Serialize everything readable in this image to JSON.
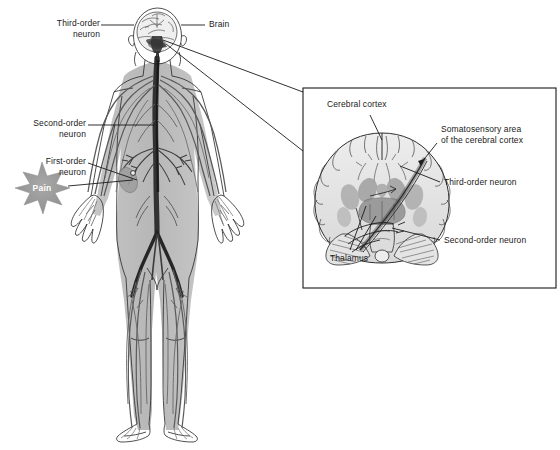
{
  "figure": {
    "background_color": "#ffffff",
    "line_color": "#1a1a1a",
    "body_fill": "#b9b9b9",
    "nerve_color": "#5a5a5a",
    "spinal_cord_color": "#2b2b2b",
    "brain_fill": "#e2e2e2",
    "gray_matter_color": "#a6a6a6",
    "star_fill": "#9a9a9a",
    "star_text_color": "#ffffff"
  },
  "body_panel": {
    "labels": {
      "third_order_neuron": "Third-order\nneuron",
      "brain": "Brain",
      "second_order_neuron": "Second-order\nneuron",
      "first_order_neuron": "First-order\nneuron",
      "pain": "Pain"
    }
  },
  "inset_panel": {
    "border_color": "#1a1a1a",
    "labels": {
      "cerebral_cortex": "Cerebral cortex",
      "somatosensory_area": "Somatosensory area\nof the cerebral cortex",
      "third_order_neuron": "Third-order neuron",
      "second_order_neuron": "Second-order neuron",
      "thalamus": "Thalamus"
    }
  }
}
